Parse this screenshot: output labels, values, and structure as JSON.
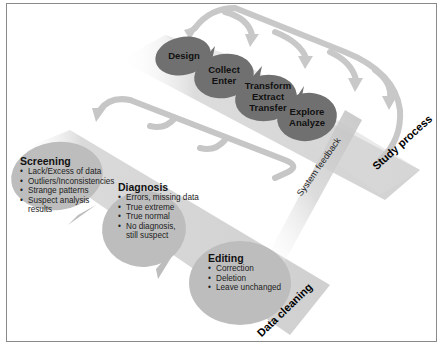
{
  "diagram": {
    "study_process": {
      "band_label": "Study process",
      "stages": [
        {
          "id": "design",
          "lines": [
            "Design"
          ]
        },
        {
          "id": "collect-enter",
          "lines": [
            "Collect",
            "Enter"
          ]
        },
        {
          "id": "transform-extract-transfer",
          "lines": [
            "Transform",
            "Extract",
            "Transfer"
          ]
        },
        {
          "id": "explore-analyze",
          "lines": [
            "Explore",
            "Analyze"
          ]
        }
      ]
    },
    "feedback": {
      "label": "System feedback"
    },
    "data_cleaning": {
      "band_label": "Data cleaning",
      "stages": [
        {
          "id": "screening",
          "title": "Screening",
          "items": [
            "Lack/Excess of data",
            "Outliers/Inconsistencies",
            "Strange patterns",
            "Suspect analysis results"
          ]
        },
        {
          "id": "diagnosis",
          "title": "Diagnosis",
          "items": [
            "Errors, missing data",
            "True extreme",
            "True normal",
            "No diagnosis, still suspect"
          ]
        },
        {
          "id": "editing",
          "title": "Editing",
          "items": [
            "Correction",
            "Deletion",
            "Leave unchanged"
          ]
        }
      ]
    },
    "colors": {
      "study_oval": "#707070",
      "study_band": "#d9d9d9",
      "cleaning_oval": "#bdbdbd",
      "cleaning_band": "#d4d4d4",
      "arrow": "#c8c8c8",
      "frame_border": "#8a8a8a"
    }
  }
}
